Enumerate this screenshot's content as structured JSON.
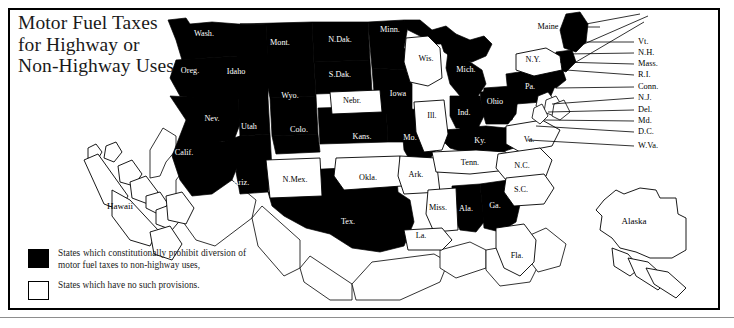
{
  "title": {
    "line1": "Motor Fuel Taxes",
    "line2": "for Highway or",
    "line3": "Non-Highway Uses"
  },
  "legend": {
    "black_label": "States which constitutionally prohibit diversion of motor fuel taxes to non-highway uses,",
    "white_label": "States which have no such provisions.",
    "black_color": "#000000",
    "white_color": "#ffffff"
  },
  "map": {
    "prohibit_states": [
      "Wash.",
      "Oreg.",
      "Idaho",
      "Mont.",
      "N.Dak.",
      "S.Dak.",
      "Minn.",
      "Iowa",
      "Mo.",
      "Wyo.",
      "Nev.",
      "Utah",
      "Colo.",
      "Kans.",
      "Calif.",
      "Ariz.",
      "Tex.",
      "Ky.",
      "Mich.",
      "Ind.",
      "Ohio",
      "Ala.",
      "Ga.",
      "Pa.",
      "Maine"
    ],
    "no_provision_states": [
      "Nebr.",
      "Wis.",
      "Ill.",
      "N.Mex.",
      "Okla.",
      "Ark.",
      "Miss.",
      "La.",
      "Tenn.",
      "Va.",
      "N.C.",
      "S.C.",
      "Fla.",
      "N.Y.",
      "Hawaii",
      "Alaska",
      "Vt.",
      "N.H.",
      "Mass.",
      "R.I.",
      "Conn.",
      "N.J.",
      "Del.",
      "Md.",
      "D.C.",
      "W.Va."
    ],
    "labels": [
      {
        "name": "Wash.",
        "x": 204,
        "y": 34,
        "tone": "black"
      },
      {
        "name": "Oreg.",
        "x": 190,
        "y": 71,
        "tone": "black"
      },
      {
        "name": "Idaho",
        "x": 236,
        "y": 72,
        "tone": "black"
      },
      {
        "name": "Mont.",
        "x": 280,
        "y": 43,
        "tone": "black"
      },
      {
        "name": "N.Dak.",
        "x": 340,
        "y": 40,
        "tone": "black"
      },
      {
        "name": "S.Dak.",
        "x": 340,
        "y": 75,
        "tone": "black"
      },
      {
        "name": "Minn.",
        "x": 390,
        "y": 30,
        "tone": "black"
      },
      {
        "name": "Wis.",
        "x": 426,
        "y": 59,
        "tone": "black"
      },
      {
        "name": "Iowa",
        "x": 398,
        "y": 94,
        "tone": "black"
      },
      {
        "name": "Nebr.",
        "x": 352,
        "y": 100,
        "tone": "black"
      },
      {
        "name": "Wyo.",
        "x": 290,
        "y": 96,
        "tone": "black"
      },
      {
        "name": "Nev.",
        "x": 212,
        "y": 119,
        "tone": "black"
      },
      {
        "name": "Utah",
        "x": 249,
        "y": 127,
        "tone": "black"
      },
      {
        "name": "Colo.",
        "x": 299,
        "y": 130,
        "tone": "black"
      },
      {
        "name": "Kans.",
        "x": 362,
        "y": 137,
        "tone": "black"
      },
      {
        "name": "Mo.",
        "x": 410,
        "y": 138,
        "tone": "black"
      },
      {
        "name": "Ill.",
        "x": 432,
        "y": 116,
        "tone": "black"
      },
      {
        "name": "Ind.",
        "x": 464,
        "y": 113,
        "tone": "black"
      },
      {
        "name": "Mich.",
        "x": 466,
        "y": 70,
        "tone": "black"
      },
      {
        "name": "Ohio",
        "x": 495,
        "y": 102,
        "tone": "black"
      },
      {
        "name": "Pa.",
        "x": 530,
        "y": 87,
        "tone": "black"
      },
      {
        "name": "N.Y.",
        "x": 533,
        "y": 60,
        "tone": "black"
      },
      {
        "name": "Maine",
        "x": 548,
        "y": 15,
        "tone": "black"
      },
      {
        "name": "Ky.",
        "x": 480,
        "y": 141,
        "tone": "black"
      },
      {
        "name": "Va.",
        "x": 529,
        "y": 140,
        "tone": "black"
      },
      {
        "name": "Tenn.",
        "x": 470,
        "y": 163,
        "tone": "black"
      },
      {
        "name": "N.C.",
        "x": 522,
        "y": 166,
        "tone": "black"
      },
      {
        "name": "S.C.",
        "x": 521,
        "y": 190,
        "tone": "black"
      },
      {
        "name": "Ga.",
        "x": 495,
        "y": 206,
        "tone": "black"
      },
      {
        "name": "Ala.",
        "x": 466,
        "y": 209,
        "tone": "black"
      },
      {
        "name": "Miss.",
        "x": 438,
        "y": 208,
        "tone": "black"
      },
      {
        "name": "Ark.",
        "x": 416,
        "y": 175,
        "tone": "black"
      },
      {
        "name": "La.",
        "x": 421,
        "y": 236,
        "tone": "black"
      },
      {
        "name": "Fla.",
        "x": 517,
        "y": 256,
        "tone": "black"
      },
      {
        "name": "Okla.",
        "x": 368,
        "y": 178,
        "tone": "black"
      },
      {
        "name": "N.Mex.",
        "x": 295,
        "y": 180,
        "tone": "black"
      },
      {
        "name": "Ariz.",
        "x": 241,
        "y": 183,
        "tone": "black"
      },
      {
        "name": "Calif.",
        "x": 184,
        "y": 153,
        "tone": "black"
      },
      {
        "name": "Tex.",
        "x": 348,
        "y": 222,
        "tone": "black"
      }
    ],
    "callouts": [
      "Vt.",
      "N.H.",
      "Mass.",
      "R.I.",
      "Conn.",
      "N.J.",
      "Del.",
      "Md.",
      "D.C.",
      "W.Va."
    ],
    "insets": [
      "Hawaii",
      "Alaska"
    ]
  }
}
